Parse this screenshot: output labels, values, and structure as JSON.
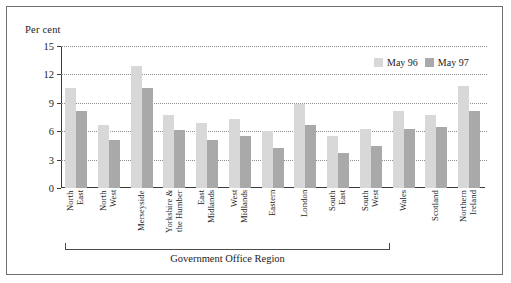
{
  "chart_data": {
    "type": "bar",
    "title": "",
    "ylabel": "Per cent",
    "xlabel": "Government Office Region",
    "ylim": [
      0,
      15
    ],
    "yticks": [
      0,
      3,
      6,
      9,
      12,
      15
    ],
    "grid": true,
    "legend_position": "top-right",
    "categories": [
      "North\nEast",
      "North\nWest",
      "Merseyside",
      "Yorkshire &\nthe Humber",
      "East\nMidlands",
      "West\nMidlands",
      "Eastern",
      "London",
      "South\nEast",
      "South\nWest",
      "Wales",
      "Scotland",
      "Northern\nIreland"
    ],
    "series": [
      {
        "name": "May 96",
        "color": "#d8d8d8",
        "values": [
          10.6,
          6.7,
          12.9,
          7.7,
          6.9,
          7.3,
          6.0,
          8.9,
          5.5,
          6.2,
          8.1,
          7.7,
          10.8
        ]
      },
      {
        "name": "May 97",
        "color": "#a9a9a9",
        "values": [
          8.1,
          5.1,
          10.6,
          6.1,
          5.1,
          5.5,
          4.2,
          6.7,
          3.7,
          4.4,
          6.2,
          6.4,
          8.1
        ]
      }
    ],
    "bracket": {
      "label": "Government Office Region",
      "covers_from": "North East",
      "covers_to": "South West"
    }
  }
}
